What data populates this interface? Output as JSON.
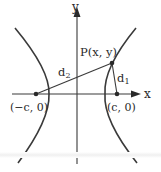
{
  "diagram": {
    "type": "hyperbola-focal-distances",
    "colors": {
      "stroke": "#3a3a3a",
      "text": "#2a2a2a",
      "background": "#ffffff"
    },
    "axes": {
      "x_label": "x",
      "y_label": "y"
    },
    "point": {
      "label": "P(x, y)"
    },
    "foci": {
      "left_label": "(−c, 0)",
      "right_label": "(c, 0)"
    },
    "distances": {
      "d1_base": "d",
      "d1_sub": "1",
      "d2_base": "d",
      "d2_sub": "2"
    }
  }
}
